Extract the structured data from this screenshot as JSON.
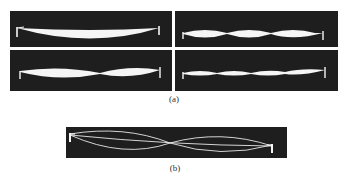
{
  "figure": {
    "part_a": {
      "caption": "(a)",
      "panels": [
        {
          "position": "top-left",
          "mode": 1,
          "description": "single loop standing wave"
        },
        {
          "position": "top-right",
          "mode": 3,
          "description": "three loop standing wave"
        },
        {
          "position": "bottom-left",
          "mode": 2,
          "description": "two loop standing wave"
        },
        {
          "position": "bottom-right",
          "mode": 4,
          "description": "four loop standing wave"
        }
      ]
    },
    "part_b": {
      "caption": "(b)",
      "description": "superposition of two modes of vibrating string"
    },
    "colors": {
      "background": "#ffffff",
      "panel": "#1e1e1e",
      "string": "#f5f5f5"
    }
  }
}
